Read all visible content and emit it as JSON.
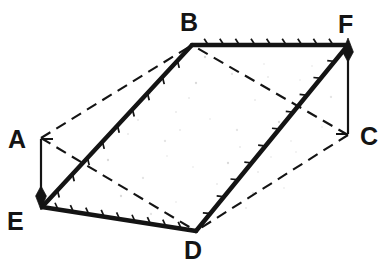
{
  "figure": {
    "kind": "geometry-diagram",
    "canvas": {
      "width": 389,
      "height": 269
    },
    "background_color": "#ffffff",
    "ink_color": "#141414",
    "speckle_color": "#b9b9b9"
  },
  "vertices": [
    {
      "name": "A",
      "label": "A",
      "x": 41,
      "y": 138,
      "label_x": 8,
      "label_y": 127,
      "label_anchor": "left-of-point"
    },
    {
      "name": "B",
      "label": "B",
      "x": 192,
      "y": 45,
      "label_x": 180,
      "label_y": 10,
      "label_anchor": "above-point"
    },
    {
      "name": "C",
      "label": "C",
      "x": 348,
      "y": 135,
      "label_x": 360,
      "label_y": 124,
      "label_anchor": "right-of-point"
    },
    {
      "name": "D",
      "label": "D",
      "x": 196,
      "y": 231,
      "label_x": 184,
      "label_y": 238,
      "label_anchor": "below-point"
    },
    {
      "name": "E",
      "label": "E",
      "x": 42,
      "y": 207,
      "label_x": 7,
      "label_y": 209,
      "label_anchor": "below-left-of-point"
    },
    {
      "name": "F",
      "label": "F",
      "x": 348,
      "y": 45,
      "label_x": 338,
      "label_y": 12,
      "label_anchor": "above-point"
    }
  ],
  "solid_edges": [
    {
      "name": "edge-B-F",
      "from": "B",
      "to": "F",
      "hatched": true,
      "hatch_side": "above",
      "hatch_count": 9
    },
    {
      "name": "edge-E-B",
      "from": "E",
      "to": "B",
      "hatched": true,
      "hatch_side": "right",
      "hatch_count": 9
    },
    {
      "name": "edge-E-D",
      "from": "E",
      "to": "D",
      "hatched": true,
      "hatch_side": "above",
      "hatch_count": 9
    },
    {
      "name": "edge-D-F",
      "from": "D",
      "to": "F",
      "hatched": true,
      "hatch_side": "left",
      "hatch_count": 10
    }
  ],
  "dashed_edges": [
    {
      "name": "edge-A-B",
      "from": "A",
      "to": "B"
    },
    {
      "name": "edge-A-D",
      "from": "A",
      "to": "D"
    },
    {
      "name": "edge-C-B",
      "from": "C",
      "to": "B"
    },
    {
      "name": "edge-C-D",
      "from": "C",
      "to": "D"
    }
  ],
  "arrows": [
    {
      "name": "arrow-A-to-E",
      "from": "A",
      "to": "E",
      "direction": "down",
      "tail_x": 41,
      "tail_y": 139,
      "head_x": 41,
      "head_y": 196
    },
    {
      "name": "arrow-C-to-F",
      "from": "C",
      "to": "F",
      "direction": "up",
      "tail_x": 348,
      "tail_y": 134,
      "head_x": 348,
      "head_y": 52
    }
  ],
  "speckles": [
    [
      232,
      74
    ],
    [
      268,
      77
    ],
    [
      300,
      80
    ],
    [
      196,
      83
    ],
    [
      150,
      94
    ],
    [
      255,
      100
    ],
    [
      331,
      97
    ],
    [
      176,
      112
    ],
    [
      210,
      119
    ],
    [
      279,
      122
    ],
    [
      322,
      127
    ],
    [
      128,
      134
    ],
    [
      165,
      141
    ],
    [
      240,
      147
    ],
    [
      296,
      152
    ],
    [
      108,
      160
    ],
    [
      193,
      167
    ],
    [
      258,
      172
    ],
    [
      143,
      178
    ],
    [
      217,
      184
    ],
    [
      284,
      188
    ],
    [
      121,
      196
    ],
    [
      176,
      202
    ],
    [
      246,
      208
    ],
    [
      151,
      214
    ],
    [
      206,
      219
    ],
    [
      264,
      64
    ],
    [
      205,
      57
    ],
    [
      312,
      66
    ],
    [
      189,
      98
    ],
    [
      237,
      130
    ],
    [
      309,
      113
    ],
    [
      167,
      156
    ],
    [
      228,
      163
    ],
    [
      291,
      141
    ],
    [
      138,
      120
    ],
    [
      253,
      193
    ],
    [
      180,
      130
    ],
    [
      271,
      157
    ],
    [
      318,
      83
    ]
  ]
}
